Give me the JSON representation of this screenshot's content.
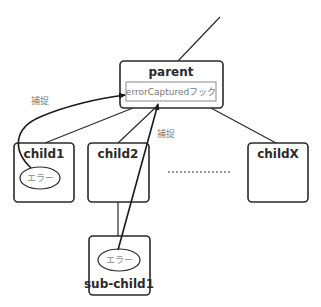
{
  "diagram": {
    "nodes": {
      "parent": {
        "label": "parent",
        "hook": "errorCapturedフック"
      },
      "child1": {
        "label": "child1",
        "error": "エラー"
      },
      "child2": {
        "label": "child2"
      },
      "childX": {
        "label": "childX"
      },
      "subchild1": {
        "label": "sub-child1",
        "error": "エラー"
      }
    },
    "edge_labels": {
      "capture_left": "捕捉",
      "capture_right": "捕捉"
    },
    "colors": {
      "stroke": "#2a2a2a",
      "hook_border": "#8a8a8a",
      "muted_text": "#7a7a7a"
    }
  }
}
